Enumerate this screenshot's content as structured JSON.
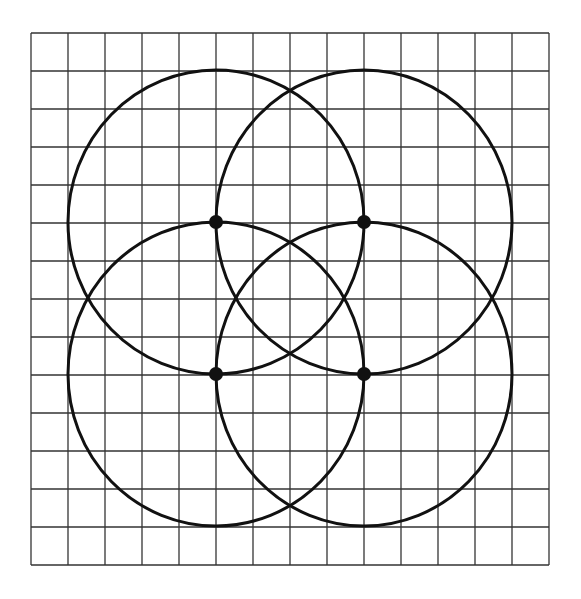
{
  "diagram": {
    "grid": {
      "left": 31,
      "top": 33,
      "columns": 14,
      "rows": 14,
      "cell_width": 37,
      "cell_height": 38,
      "line_color": "#333333"
    },
    "circles": [
      {
        "cx": 216,
        "cy": 222,
        "rx": 148,
        "ry": 152
      },
      {
        "cx": 364,
        "cy": 222,
        "rx": 148,
        "ry": 152
      },
      {
        "cx": 216,
        "cy": 374,
        "rx": 148,
        "ry": 152
      },
      {
        "cx": 364,
        "cy": 374,
        "rx": 148,
        "ry": 152
      }
    ],
    "points": [
      {
        "x": 216,
        "y": 222
      },
      {
        "x": 364,
        "y": 222
      },
      {
        "x": 216,
        "y": 374
      },
      {
        "x": 364,
        "y": 374
      }
    ],
    "stroke_color": "#111111"
  }
}
